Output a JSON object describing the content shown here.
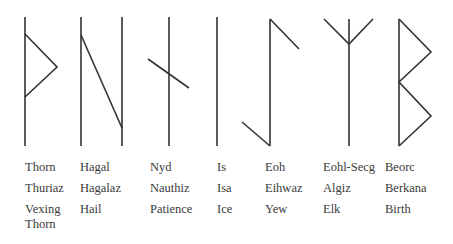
{
  "stroke_color": "#333333",
  "text_color": "#3a3a3a",
  "runes": [
    {
      "id": "thorn",
      "names": [
        "Thorn",
        "Thuriaz",
        "Vexing Thorn"
      ],
      "label_x": 25
    },
    {
      "id": "hagal",
      "names": [
        "Hagal",
        "Hagalaz",
        "Hail"
      ],
      "label_x": 80
    },
    {
      "id": "nyd",
      "names": [
        "Nyd",
        "Nauthiz",
        "Patience"
      ],
      "label_x": 150
    },
    {
      "id": "is",
      "names": [
        "Is",
        "Isa",
        "Ice"
      ],
      "label_x": 217
    },
    {
      "id": "eoh",
      "names": [
        "Eoh",
        "Eihwaz",
        "Yew"
      ],
      "label_x": 265
    },
    {
      "id": "eohl-secg",
      "names": [
        "Eohl-Secg",
        "Algiz",
        "Elk"
      ],
      "label_x": 323
    },
    {
      "id": "beorc",
      "names": [
        "Beorc",
        "Berkana",
        "Birth"
      ],
      "label_x": 385
    }
  ]
}
